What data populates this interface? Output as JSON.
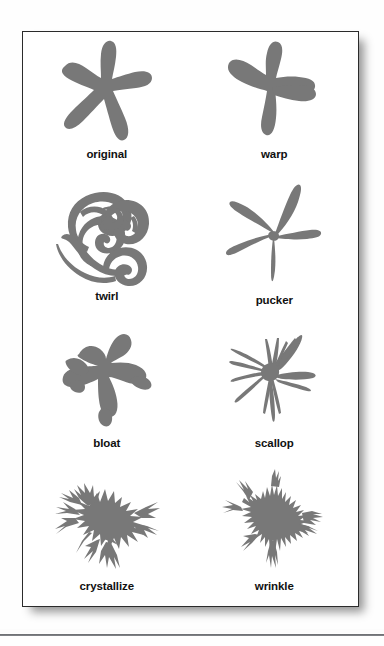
{
  "figure": {
    "shape_fill": "#787878",
    "frame_border": "#2b2b2b",
    "background": "#fefefe",
    "cells": [
      {
        "label": "original",
        "icon": "starfish-original-shape"
      },
      {
        "label": "warp",
        "icon": "starfish-warp-shape"
      },
      {
        "label": "twirl",
        "icon": "starfish-twirl-shape"
      },
      {
        "label": "pucker",
        "icon": "starfish-pucker-shape"
      },
      {
        "label": "bloat",
        "icon": "starfish-bloat-shape"
      },
      {
        "label": "scallop",
        "icon": "starfish-scallop-shape"
      },
      {
        "label": "crystallize",
        "icon": "starfish-crystallize-shape"
      },
      {
        "label": "wrinkle",
        "icon": "starfish-wrinkle-shape"
      }
    ]
  }
}
